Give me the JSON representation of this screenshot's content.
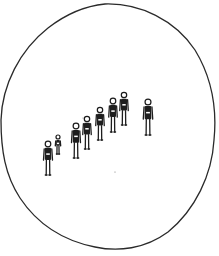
{
  "drawing": {
    "subject": "Line drawing of a row of human figures inside an irregular oval boundary",
    "boundary": {
      "shape": "irregular-oval",
      "stroke": "#2a2a2a",
      "top": 4,
      "bottom": 250,
      "left": 1,
      "right": 215
    },
    "figures": [
      {
        "id": 1,
        "head_x": 48,
        "head_y": 144,
        "feet_y": 175,
        "scale": 1.0
      },
      {
        "id": 2,
        "head_x": 58,
        "head_y": 137,
        "feet_y": 154,
        "scale": 0.6
      },
      {
        "id": 3,
        "head_x": 76,
        "head_y": 126,
        "feet_y": 158,
        "scale": 1.0
      },
      {
        "id": 4,
        "head_x": 87,
        "head_y": 119,
        "feet_y": 149,
        "scale": 0.95
      },
      {
        "id": 5,
        "head_x": 100,
        "head_y": 110,
        "feet_y": 140,
        "scale": 0.95
      },
      {
        "id": 6,
        "head_x": 113,
        "head_y": 101,
        "feet_y": 132,
        "scale": 0.95
      },
      {
        "id": 7,
        "head_x": 124,
        "head_y": 95,
        "feet_y": 125,
        "scale": 0.95
      },
      {
        "id": 8,
        "head_x": 148,
        "head_y": 102,
        "feet_y": 135,
        "scale": 1.05
      }
    ],
    "colors": {
      "background": "#ffffff",
      "ink": "#1e1e1e"
    }
  }
}
